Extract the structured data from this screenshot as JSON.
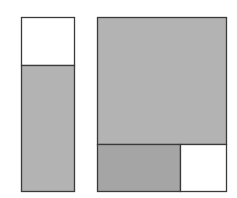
{
  "diagram": {
    "type": "area-model",
    "colors": {
      "background": "#ffffff",
      "stroke": "#3a3a3a",
      "shaded": "#b3b3b3",
      "shaded_dark": "#a5a5a5",
      "unshaded": "#ffffff"
    },
    "left_figure": {
      "description": "Tall rectangle divided horizontally; top part unshaded, bottom part shaded",
      "regions": [
        {
          "name": "top",
          "shaded": false
        },
        {
          "name": "bottom",
          "shaded": true
        }
      ]
    },
    "right_figure": {
      "description": "Square-like rectangle; large shaded top region, bottom strip split into shaded left and unshaded right",
      "regions": [
        {
          "name": "top",
          "shaded": true
        },
        {
          "name": "bottom-left",
          "shaded": true
        },
        {
          "name": "bottom-right",
          "shaded": false
        }
      ]
    }
  }
}
